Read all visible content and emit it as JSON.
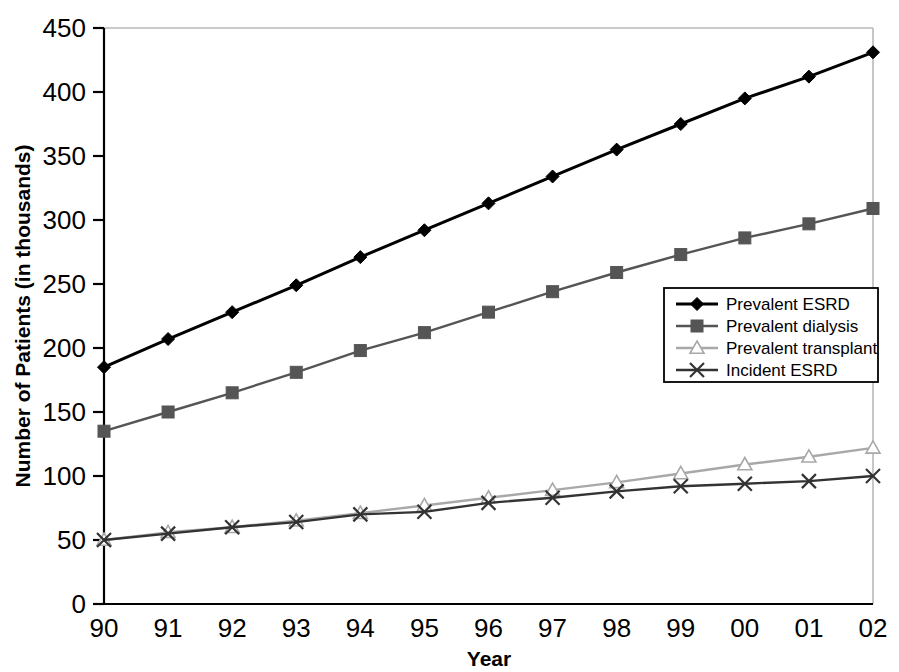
{
  "chart_data": {
    "type": "line",
    "title": "",
    "xlabel": "Year",
    "ylabel": "Number of Patients (in thousands)",
    "categories": [
      "90",
      "91",
      "92",
      "93",
      "94",
      "95",
      "96",
      "97",
      "98",
      "99",
      "00",
      "01",
      "02"
    ],
    "x": [
      1990,
      1991,
      1992,
      1993,
      1994,
      1995,
      1996,
      1997,
      1998,
      1999,
      2000,
      2001,
      2002
    ],
    "ylim": [
      0,
      450
    ],
    "ytick_values": [
      0,
      50,
      100,
      150,
      200,
      250,
      300,
      350,
      400,
      450
    ],
    "ytick_labels": [
      "0",
      "50",
      "100",
      "150",
      "200",
      "250",
      "300",
      "350",
      "400",
      "450"
    ],
    "grid": false,
    "legend_position": "center-right",
    "series": [
      {
        "name": "Prevalent ESRD",
        "marker": "diamond",
        "color": "#000000",
        "values": [
          185,
          207,
          228,
          249,
          271,
          292,
          313,
          334,
          355,
          375,
          395,
          412,
          431
        ]
      },
      {
        "name": "Prevalent dialysis",
        "marker": "square",
        "color": "#555555",
        "values": [
          135,
          150,
          165,
          181,
          198,
          212,
          228,
          244,
          259,
          273,
          286,
          297,
          309
        ]
      },
      {
        "name": "Prevalent transplant",
        "marker": "triangle-open",
        "color": "#a8a8a8",
        "values": [
          50,
          56,
          60,
          65,
          71,
          77,
          83,
          89,
          95,
          102,
          109,
          115,
          122
        ]
      },
      {
        "name": "Incident ESRD",
        "marker": "cross",
        "color": "#333333",
        "values": [
          50,
          55,
          60,
          64,
          70,
          72,
          79,
          83,
          88,
          92,
          94,
          96,
          100
        ]
      }
    ]
  },
  "legend": {
    "entries": [
      {
        "label": "Prevalent ESRD"
      },
      {
        "label": "Prevalent dialysis"
      },
      {
        "label": "Prevalent transplant"
      },
      {
        "label": "Incident ESRD"
      }
    ]
  }
}
